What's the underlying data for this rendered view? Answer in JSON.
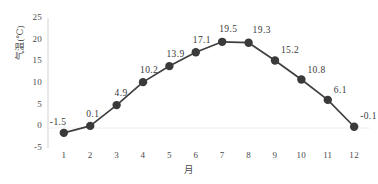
{
  "chart_data": {
    "type": "line",
    "title": "",
    "subtitle": "",
    "xlabel": "月",
    "ylabel": "气温(℃)",
    "categories": [
      "1",
      "2",
      "3",
      "4",
      "5",
      "6",
      "7",
      "8",
      "9",
      "10",
      "11",
      "12"
    ],
    "x": [
      1,
      2,
      3,
      4,
      5,
      6,
      7,
      8,
      9,
      10,
      11,
      12
    ],
    "values": [
      -1.5,
      0.1,
      4.9,
      10.2,
      13.9,
      17.1,
      19.5,
      19.3,
      15.2,
      10.8,
      6.1,
      -0.1
    ],
    "point_labels": [
      "-1.5",
      "0.1",
      "4.9",
      "10.2",
      "13.9",
      "17.1",
      "19.5",
      "19.3",
      "15.2",
      "10.8",
      "6.1",
      "-0.1"
    ],
    "xlim": [
      0.4,
      12.6
    ],
    "ylim": [
      -5,
      25
    ],
    "yticks": [
      -5,
      0,
      5,
      10,
      15,
      20,
      25
    ],
    "ytick_labels": [
      "-5",
      "0",
      "5",
      "10",
      "15",
      "20",
      "25"
    ],
    "xticks": [
      1,
      2,
      3,
      4,
      5,
      6,
      7,
      8,
      9,
      10,
      11,
      12
    ],
    "xtick_labels": [
      "1",
      "2",
      "3",
      "4",
      "5",
      "6",
      "7",
      "8",
      "9",
      "10",
      "11",
      "12"
    ],
    "grid": "horizontal-zero-only",
    "legend": "none",
    "marker": "circle",
    "colors": {
      "line": "#3f3f3f",
      "marker": "#3a3a3a",
      "axis": "#d0d0d0",
      "gridline": "#ececec",
      "tick_text": "#4a4a4a",
      "label_text": "#3a3a3a",
      "background": "#ffffff"
    }
  }
}
